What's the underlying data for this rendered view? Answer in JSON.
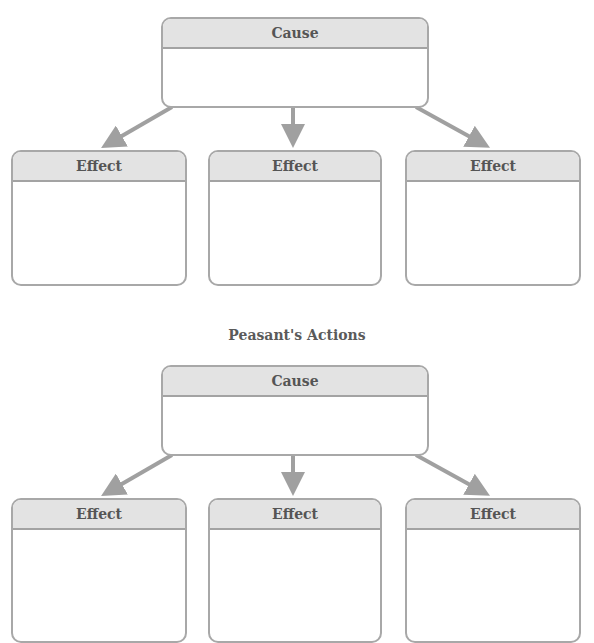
{
  "colors": {
    "border": "#a8a8a8",
    "header_fill": "#e3e3e3",
    "arrow": "#a0a0a0",
    "text": "#555555"
  },
  "diagrams": [
    {
      "title": "",
      "cause": {
        "label": "Cause",
        "content": ""
      },
      "effects": [
        {
          "label": "Effect",
          "content": ""
        },
        {
          "label": "Effect",
          "content": ""
        },
        {
          "label": "Effect",
          "content": ""
        }
      ]
    },
    {
      "title": "Peasant's Actions",
      "cause": {
        "label": "Cause",
        "content": ""
      },
      "effects": [
        {
          "label": "Effect",
          "content": ""
        },
        {
          "label": "Effect",
          "content": ""
        },
        {
          "label": "Effect",
          "content": ""
        }
      ]
    }
  ]
}
